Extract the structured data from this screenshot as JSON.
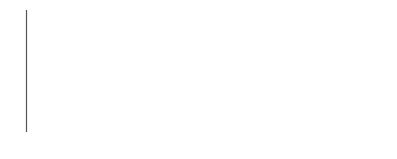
{
  "chart_data": {
    "type": "line",
    "title": "",
    "xlabel": "Time (sec)",
    "ylabel": "ETCO2 (mmHg)",
    "ylabel_main": "ETCO",
    "ylabel_sub": "2",
    "ylabel_units": " (mmHg)",
    "yticks": [
      5,
      10,
      15,
      20,
      25,
      30,
      35,
      40,
      45,
      50
    ],
    "ylim": [
      0,
      50
    ],
    "xticks": [],
    "grid": false,
    "legend": null,
    "series": [
      {
        "name": "ETCO2 waveform",
        "x": [
          0,
          39,
          39,
          101,
          101,
          148,
          148,
          210,
          210,
          259,
          259,
          319,
          319,
          362
        ],
        "values": [
          0,
          0,
          12,
          12,
          0,
          0,
          12,
          12,
          0,
          0,
          12,
          12,
          0,
          0
        ]
      }
    ],
    "pulses": [
      {
        "start_px": 65,
        "end_px": 127,
        "plateau": 12
      },
      {
        "start_px": 174,
        "end_px": 236,
        "plateau": 12
      },
      {
        "start_px": 285,
        "end_px": 345,
        "plateau": 12
      }
    ]
  },
  "colors": {
    "axis": "#555555",
    "pulse": "#888888",
    "baseline": "#555555",
    "text": "#222222"
  }
}
